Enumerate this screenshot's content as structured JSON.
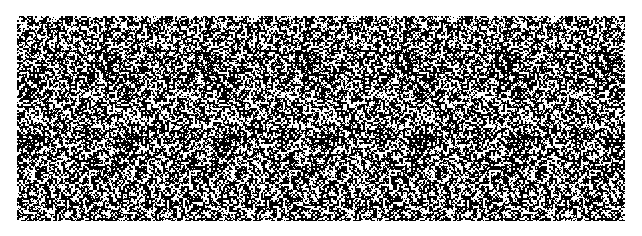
{
  "image": {
    "kind": "random-dot autostereogram",
    "background_color": "#ffffff",
    "pattern_colors": [
      "#000000",
      "#ffffff"
    ],
    "pattern": {
      "left": 17,
      "top": 16,
      "width": 608,
      "height": 205,
      "tile_period_px": 100,
      "white_density": 0.42
    }
  }
}
